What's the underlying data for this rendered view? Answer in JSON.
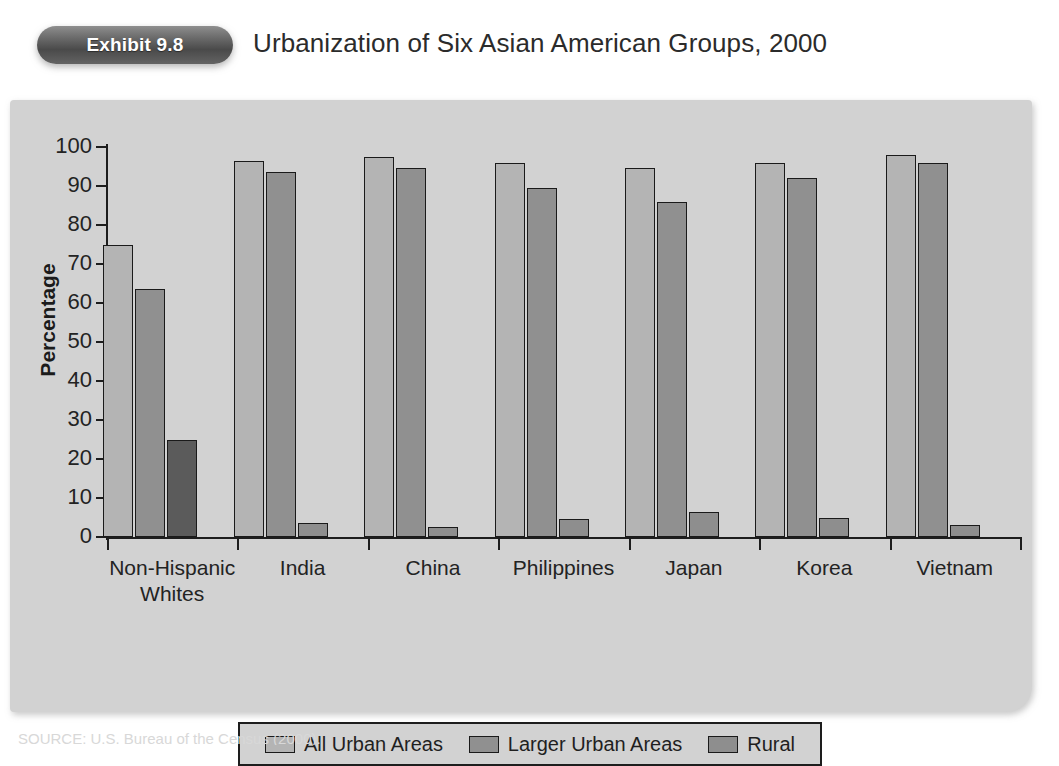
{
  "header": {
    "exhibit_badge": "Exhibit 9.8",
    "title": "Urbanization of Six Asian American Groups, 2000"
  },
  "source_note": "SOURCE: U.S. Bureau of the Census (2000).",
  "legend": {
    "items": [
      {
        "label": "All Urban Areas",
        "color": "#b4b4b4"
      },
      {
        "label": "Larger Urban Areas",
        "color": "#909090"
      },
      {
        "label": "Rural",
        "color": "#8e8e8e"
      }
    ]
  },
  "chart_data": {
    "type": "bar",
    "title": "Urbanization of Six Asian American Groups, 2000",
    "xlabel": "",
    "ylabel": "Percentage",
    "ylim": [
      0,
      100
    ],
    "ytick_step": 10,
    "ytick_labels": [
      "100",
      "90",
      "80",
      "70",
      "60",
      "50",
      "40",
      "30",
      "20",
      "10",
      "0"
    ],
    "grid": false,
    "legend_position": "bottom",
    "categories": [
      "Non-Hispanic\nWhites",
      "India",
      "China",
      "Philippines",
      "Japan",
      "Korea",
      "Vietnam"
    ],
    "series": [
      {
        "name": "All Urban Areas",
        "color": "#b4b4b4",
        "values": [
          75.0,
          96.5,
          97.5,
          96.0,
          94.5,
          96.0,
          98.0
        ]
      },
      {
        "name": "Larger Urban Areas",
        "color": "#909090",
        "values": [
          63.5,
          93.5,
          94.5,
          89.5,
          86.0,
          92.0,
          96.0
        ]
      },
      {
        "name": "Rural",
        "color": "#8e8e8e",
        "values": [
          25.0,
          3.5,
          2.5,
          4.5,
          6.3,
          5.0,
          3.0
        ]
      }
    ]
  }
}
